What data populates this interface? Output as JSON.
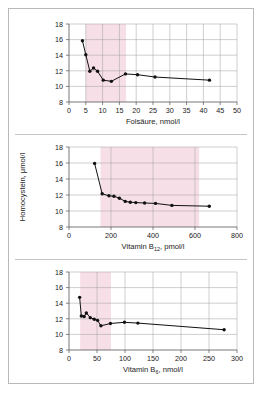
{
  "figure": {
    "panel_count": 3,
    "shared_ylabel": "Homocystein, μmol/l",
    "border_color": "#b9b9b9",
    "band_color": "#f7dfe7",
    "line_color": "#111111"
  },
  "chart_data": [
    {
      "id": "panel-folsaeure",
      "type": "line",
      "title": "",
      "xlabel": "Folsäure, nmol/l",
      "ylabel": "Homocystein, μmol/l",
      "xlim": [
        0,
        50
      ],
      "ylim": [
        8,
        18
      ],
      "xticks": [
        0,
        5,
        10,
        15,
        20,
        25,
        30,
        35,
        40,
        45,
        50
      ],
      "xtick_labels": [
        "0",
        "5",
        "10",
        "15",
        "20",
        "25",
        "30",
        "35",
        "40",
        "45",
        "50"
      ],
      "yticks": [
        8,
        10,
        12,
        14,
        16,
        18
      ],
      "ytick_labels": [
        "8",
        "10",
        "12",
        "14",
        "16",
        "18"
      ],
      "grid": true,
      "legend": "none",
      "shaded_band": {
        "x_start": 5.0,
        "x_end": 17.0,
        "color": "#f7dfe7"
      },
      "x": [
        4.0,
        5.0,
        6.2,
        7.3,
        8.5,
        10.2,
        12.6,
        16.8,
        20.4,
        25.6,
        41.8
      ],
      "y": [
        15.85,
        14.05,
        11.95,
        12.35,
        11.95,
        10.8,
        10.65,
        11.6,
        11.5,
        11.2,
        10.8
      ]
    },
    {
      "id": "panel-vitamin-b12",
      "type": "line",
      "title": "",
      "xlabel": "Vitamin B12, pmol/l",
      "xlabel_base": "Vitamin B",
      "xlabel_sub": "12",
      "xlabel_tail": ", pmol/l",
      "ylabel": "Homocystein, μmol/l",
      "xlim": [
        0,
        800
      ],
      "ylim": [
        8,
        18
      ],
      "xticks": [
        0,
        200,
        400,
        600,
        800
      ],
      "xtick_labels": [
        "0",
        "200",
        "400",
        "600",
        "800"
      ],
      "yticks": [
        8,
        10,
        12,
        14,
        16,
        18
      ],
      "ytick_labels": [
        "8",
        "10",
        "12",
        "14",
        "16",
        "18"
      ],
      "grid": true,
      "legend": "none",
      "shaded_band": {
        "x_start": 150,
        "x_end": 620,
        "color": "#f7dfe7"
      },
      "x": [
        122,
        158,
        190,
        214,
        240,
        268,
        292,
        318,
        360,
        412,
        490,
        668
      ],
      "y": [
        15.95,
        12.15,
        11.9,
        11.85,
        11.6,
        11.2,
        11.1,
        11.05,
        11.0,
        10.95,
        10.7,
        10.6
      ]
    },
    {
      "id": "panel-vitamin-b6",
      "type": "line",
      "title": "",
      "xlabel": "Vitamin B6, nmol/l",
      "xlabel_base": "Vitamin B",
      "xlabel_sub": "6",
      "xlabel_tail": ", nmol/l",
      "ylabel": "Homocystein, μmol/l",
      "xlim": [
        0,
        300
      ],
      "ylim": [
        8,
        18
      ],
      "xticks": [
        0,
        50,
        100,
        150,
        200,
        250,
        300
      ],
      "xtick_labels": [
        "0",
        "50",
        "100",
        "150",
        "200",
        "250",
        "300"
      ],
      "yticks": [
        8,
        10,
        12,
        14,
        16,
        18
      ],
      "ytick_labels": [
        "8",
        "10",
        "12",
        "14",
        "16",
        "18"
      ],
      "grid": true,
      "legend": "none",
      "shaded_band": {
        "x_start": 20,
        "x_end": 75,
        "color": "#f7dfe7"
      },
      "x": [
        19,
        22,
        27,
        31,
        38,
        45,
        51,
        57,
        74,
        99,
        123,
        277
      ],
      "y": [
        14.75,
        12.35,
        12.3,
        12.75,
        12.15,
        11.95,
        11.8,
        11.1,
        11.4,
        11.55,
        11.45,
        10.6
      ]
    }
  ]
}
